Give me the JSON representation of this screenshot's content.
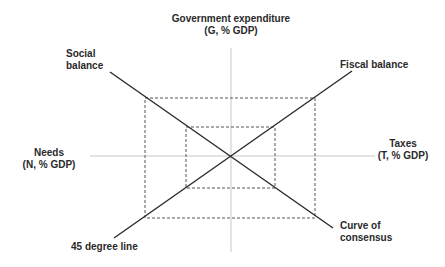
{
  "labels": {
    "government_expenditure_line1": "Government expenditure",
    "government_expenditure_line2": "(G, % GDP)",
    "social_balance_line1": "Social",
    "social_balance_line2": "balance",
    "fiscal_balance": "Fiscal balance",
    "needs_line1": "Needs",
    "needs_line2": "(N, % GDP)",
    "taxes_line1": "Taxes",
    "taxes_line2": "(T, % GDP)",
    "curve_of_consensus_line1": "Curve of",
    "curve_of_consensus_line2": "consensus",
    "forty_five_degree_line": "45 degree line"
  },
  "colors": {
    "background": "#ffffff",
    "axis": "#c8c8c8",
    "line": "#2a2a2a",
    "dashed": "#555555",
    "text": "#2a2a2a"
  }
}
